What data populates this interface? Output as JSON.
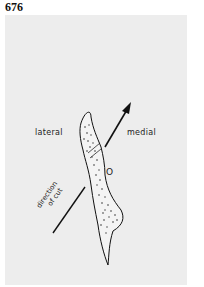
{
  "figure": {
    "number": "676",
    "labels": {
      "lateral": "lateral",
      "medial": "medial",
      "marker": "O",
      "direction_line1": "direction",
      "direction_line2": "of cut"
    },
    "colors": {
      "panel_background": "#ededed",
      "ink": "#111111"
    }
  }
}
